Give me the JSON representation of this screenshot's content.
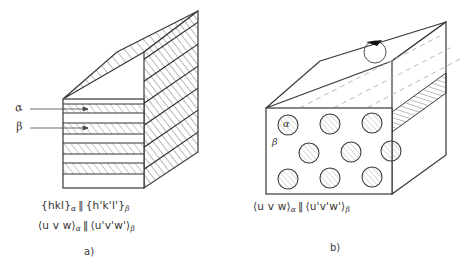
{
  "figure": {
    "type": "schematic-diagram",
    "ink_color": "#3a3836",
    "hatch_color": "#5b5955",
    "dash_color": "#b9b6b1"
  },
  "panel_a": {
    "label": "a)",
    "phase_alpha": "α",
    "phase_beta": "β",
    "caption_plane": {
      "left": "{hkl}",
      "left_sub": "α",
      "parallel": "‖",
      "right": "{h'k'l'}",
      "right_sub": "β"
    },
    "caption_direction": {
      "left": "⟨u v w⟩",
      "left_sub": "α",
      "parallel": "‖",
      "right": "⟨u'v'w'⟩",
      "right_sub": "β"
    },
    "morphology": "lamellar",
    "layer_count": 6
  },
  "panel_b": {
    "label": "b)",
    "phase_alpha": "α",
    "phase_beta": "β",
    "caption_direction": {
      "left": "⟨u v w⟩",
      "left_sub": "α",
      "parallel": "‖",
      "right": "⟨u'v'w'⟩",
      "right_sub": "β"
    },
    "morphology": "fibrous",
    "fiber_rows": 3,
    "fiber_columns": 3
  }
}
